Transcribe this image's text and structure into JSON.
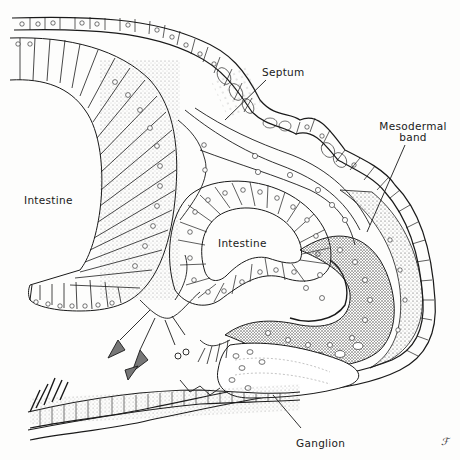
{
  "figure": {
    "ink_color": "#1a1a1a",
    "paper_color": "#fdfdfc",
    "labels": {
      "septum": "Septum",
      "mesodermal_band_line1": "Mesodermal",
      "mesodermal_band_line2": "band",
      "intestine_left": "Intestine",
      "intestine_center": "Intestine",
      "ganglion": "Ganglion"
    },
    "artist_mark": "ℱ"
  }
}
